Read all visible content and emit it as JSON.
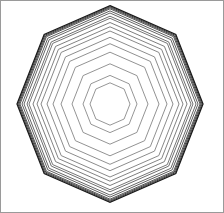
{
  "figure": {
    "shape": "octagon",
    "center": [
      110,
      104
    ],
    "orientation": "vertex-up",
    "radii": [
      20,
      27,
      38,
      49,
      57,
      63,
      69,
      73,
      77,
      81,
      83,
      86,
      88,
      90,
      91,
      92,
      93
    ],
    "colors": {
      "stroke_inner": "#8a8a8a",
      "stroke_outer": "#1a1a1a",
      "frame": "#9a9a9a",
      "background": "#ffffff"
    }
  }
}
